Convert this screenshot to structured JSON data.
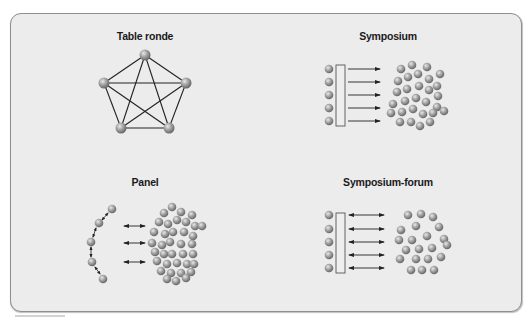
{
  "figure": {
    "frame_color": "#ececec",
    "border_color": "#8f8f8f",
    "ball_color": "#9a9a9a",
    "line_color": "#222222"
  },
  "panels": [
    {
      "id": "table-ronde",
      "title": "Table ronde",
      "title_pos": [
        145,
        30
      ],
      "type": "pentagram",
      "nodes": [
        [
          145,
          55
        ],
        [
          104,
          83
        ],
        [
          186,
          83
        ],
        [
          121,
          128
        ],
        [
          169,
          128
        ]
      ]
    },
    {
      "id": "symposium",
      "title": "Symposium",
      "title_pos": [
        388,
        30
      ],
      "type": "one-way",
      "speakers": [
        [
          329,
          69
        ],
        [
          329,
          82
        ],
        [
          329,
          95
        ],
        [
          329,
          108
        ],
        [
          329,
          121
        ]
      ],
      "podium": [
        336,
        65,
        9,
        61
      ],
      "arrows": [
        [
          348,
          69,
          380
        ],
        [
          348,
          82,
          380
        ],
        [
          348,
          95,
          380
        ],
        [
          348,
          108,
          380
        ],
        [
          348,
          121,
          380
        ]
      ],
      "audience": [
        [
          401,
          69
        ],
        [
          412,
          65
        ],
        [
          427,
          67
        ],
        [
          440,
          74
        ],
        [
          398,
          81
        ],
        [
          408,
          77
        ],
        [
          418,
          74
        ],
        [
          429,
          79
        ],
        [
          437,
          86
        ],
        [
          397,
          92
        ],
        [
          407,
          89
        ],
        [
          419,
          86
        ],
        [
          429,
          90
        ],
        [
          438,
          96
        ],
        [
          393,
          104
        ],
        [
          405,
          101
        ],
        [
          416,
          98
        ],
        [
          426,
          102
        ],
        [
          437,
          107
        ],
        [
          391,
          113
        ],
        [
          402,
          112
        ],
        [
          413,
          109
        ],
        [
          423,
          114
        ],
        [
          433,
          113
        ],
        [
          444,
          111
        ],
        [
          400,
          122
        ],
        [
          411,
          122
        ],
        [
          420,
          126
        ],
        [
          430,
          122
        ]
      ]
    },
    {
      "id": "panel",
      "title": "Panel",
      "title_pos": [
        145,
        176
      ],
      "type": "panel",
      "speakers": [
        [
          112,
          209
        ],
        [
          99,
          223
        ],
        [
          91,
          242
        ],
        [
          92,
          262
        ],
        [
          103,
          279
        ]
      ],
      "speaker_links": [
        [
          [
            108,
            213
          ],
          [
            102,
            220
          ]
        ],
        [
          [
            96,
            228
          ],
          [
            93,
            237
          ]
        ],
        [
          [
            91,
            247
          ],
          [
            91,
            257
          ]
        ],
        [
          [
            95,
            267
          ],
          [
            100,
            274
          ]
        ]
      ],
      "arrows": [
        [
          124,
          226,
          145
        ],
        [
          124,
          243,
          145
        ],
        [
          124,
          262,
          145
        ]
      ],
      "audience": [
        [
          172,
          207
        ],
        [
          164,
          213
        ],
        [
          181,
          212
        ],
        [
          192,
          215
        ],
        [
          159,
          222
        ],
        [
          168,
          224
        ],
        [
          177,
          220
        ],
        [
          186,
          222
        ],
        [
          195,
          226
        ],
        [
          202,
          226
        ],
        [
          154,
          232
        ],
        [
          165,
          234
        ],
        [
          173,
          232
        ],
        [
          184,
          232
        ],
        [
          193,
          236
        ],
        [
          152,
          243
        ],
        [
          162,
          245
        ],
        [
          170,
          242
        ],
        [
          181,
          244
        ],
        [
          192,
          244
        ],
        [
          155,
          252
        ],
        [
          164,
          254
        ],
        [
          172,
          254
        ],
        [
          183,
          254
        ],
        [
          193,
          254
        ],
        [
          157,
          261
        ],
        [
          167,
          264
        ],
        [
          177,
          263
        ],
        [
          187,
          264
        ],
        [
          194,
          264
        ],
        [
          161,
          271
        ],
        [
          171,
          273
        ],
        [
          181,
          273
        ],
        [
          191,
          272
        ],
        [
          167,
          279
        ],
        [
          176,
          281
        ],
        [
          186,
          278
        ]
      ]
    },
    {
      "id": "symposium-forum",
      "title": "Symposium-forum",
      "title_pos": [
        388,
        176
      ],
      "type": "two-way",
      "speakers": [
        [
          329,
          215
        ],
        [
          329,
          229
        ],
        [
          329,
          242
        ],
        [
          329,
          255
        ],
        [
          329,
          268
        ]
      ],
      "podium": [
        336,
        213,
        9,
        60
      ],
      "arrows": [
        [
          349,
          215,
          384
        ],
        [
          349,
          229,
          384
        ],
        [
          349,
          242,
          384
        ],
        [
          349,
          255,
          384
        ],
        [
          349,
          268,
          384
        ]
      ],
      "audience": [
        [
          408,
          215
        ],
        [
          421,
          214
        ],
        [
          433,
          217
        ],
        [
          401,
          230
        ],
        [
          416,
          226
        ],
        [
          439,
          227
        ],
        [
          399,
          240
        ],
        [
          412,
          240
        ],
        [
          427,
          236
        ],
        [
          444,
          239
        ],
        [
          406,
          250
        ],
        [
          419,
          249
        ],
        [
          432,
          248
        ],
        [
          447,
          245
        ],
        [
          400,
          259
        ],
        [
          416,
          259
        ],
        [
          428,
          259
        ],
        [
          441,
          257
        ],
        [
          411,
          270
        ],
        [
          422,
          270
        ],
        [
          434,
          270
        ]
      ]
    }
  ]
}
